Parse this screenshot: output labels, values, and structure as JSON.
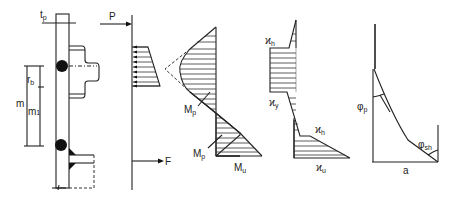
{
  "figure": {
    "panels": [
      {
        "id": "geometry",
        "labels": {
          "plate_thickness": "t",
          "plate_thickness_sub": "p",
          "bolt_distance": "r",
          "bolt_distance_sub": "b",
          "lever_arm": "m",
          "lever_arm_1": "m",
          "lever_arm_1_sub": "1"
        }
      },
      {
        "id": "loads",
        "labels": {
          "force_top": "P",
          "force_bottom": "F"
        }
      },
      {
        "id": "moment",
        "labels": {
          "plastic_moment_1": "M",
          "plastic_moment_1_sub": "p",
          "plastic_moment_2": "M",
          "plastic_moment_2_sub": "p",
          "ultimate_moment": "M",
          "ultimate_moment_sub": "u"
        }
      },
      {
        "id": "curvature",
        "labels": {
          "hardening_top": "ϰ",
          "hardening_top_sub": "h",
          "yield": "ϰ",
          "yield_sub": "y",
          "hardening_bottom": "ϰ",
          "hardening_bottom_sub": "h",
          "ultimate": "ϰ",
          "ultimate_sub": "u"
        }
      },
      {
        "id": "rotation",
        "labels": {
          "plastic_rotation": "φ",
          "plastic_rotation_sub": "p",
          "hardening_rotation": "φ",
          "hardening_rotation_sub": "sh",
          "base": "a"
        }
      }
    ]
  }
}
